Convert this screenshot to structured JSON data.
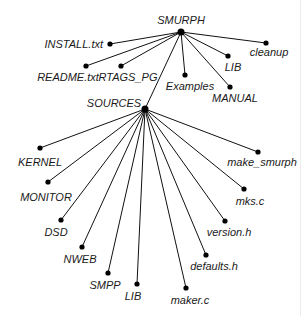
{
  "diagram": {
    "type": "tree",
    "root": "SMURPH",
    "nodes": [
      {
        "id": "smurph",
        "label": "SMURPH",
        "x": 181,
        "y": 32,
        "r": 3.5,
        "lx": 181,
        "ly": 24,
        "anchor": "middle"
      },
      {
        "id": "install",
        "label": "INSTALL.txt",
        "x": 110,
        "y": 44,
        "r": 2.6,
        "lx": 103,
        "ly": 48,
        "anchor": "end"
      },
      {
        "id": "readme",
        "label": "README.txt",
        "x": 86,
        "y": 66,
        "r": 2.6,
        "lx": 68,
        "ly": 81,
        "anchor": "middle"
      },
      {
        "id": "rtags",
        "label": "RTAGS_PG",
        "x": 121,
        "y": 66,
        "r": 2.6,
        "lx": 128,
        "ly": 81,
        "anchor": "middle"
      },
      {
        "id": "examples",
        "label": "Examples",
        "x": 185,
        "y": 75,
        "r": 2.6,
        "lx": 190,
        "ly": 90,
        "anchor": "middle"
      },
      {
        "id": "lib_top",
        "label": "LIB",
        "x": 228,
        "y": 56,
        "r": 2.6,
        "lx": 233,
        "ly": 71,
        "anchor": "middle"
      },
      {
        "id": "manual",
        "label": "MANUAL",
        "x": 230,
        "y": 87,
        "r": 2.6,
        "lx": 235,
        "ly": 102,
        "anchor": "middle"
      },
      {
        "id": "cleanup",
        "label": "cleanup",
        "x": 266,
        "y": 43,
        "r": 2.6,
        "lx": 269,
        "ly": 56,
        "anchor": "middle"
      },
      {
        "id": "sources",
        "label": "SOURCES",
        "x": 145,
        "y": 109,
        "r": 3.5,
        "lx": 114,
        "ly": 107,
        "anchor": "middle"
      },
      {
        "id": "kernel",
        "label": "KERNEL",
        "x": 40,
        "y": 148,
        "r": 2.6,
        "lx": 40,
        "ly": 166,
        "anchor": "middle"
      },
      {
        "id": "monitor",
        "label": "MONITOR",
        "x": 48,
        "y": 182,
        "r": 2.6,
        "lx": 46,
        "ly": 201,
        "anchor": "middle"
      },
      {
        "id": "dsd",
        "label": "DSD",
        "x": 61,
        "y": 220,
        "r": 2.6,
        "lx": 56,
        "ly": 236,
        "anchor": "middle"
      },
      {
        "id": "nweb",
        "label": "NWEB",
        "x": 82,
        "y": 247,
        "r": 2.6,
        "lx": 80,
        "ly": 263,
        "anchor": "middle"
      },
      {
        "id": "smpp",
        "label": "SMPP",
        "x": 108,
        "y": 273,
        "r": 2.6,
        "lx": 105,
        "ly": 289,
        "anchor": "middle"
      },
      {
        "id": "lib_src",
        "label": "LIB",
        "x": 137,
        "y": 284,
        "r": 2.6,
        "lx": 133,
        "ly": 300,
        "anchor": "middle"
      },
      {
        "id": "maker",
        "label": "maker.c",
        "x": 186,
        "y": 288,
        "r": 2.6,
        "lx": 190,
        "ly": 304,
        "anchor": "middle"
      },
      {
        "id": "defaults",
        "label": "defaults.h",
        "x": 206,
        "y": 255,
        "r": 2.6,
        "lx": 214,
        "ly": 270,
        "anchor": "middle"
      },
      {
        "id": "version",
        "label": "version.h",
        "x": 225,
        "y": 221,
        "r": 2.6,
        "lx": 229,
        "ly": 236,
        "anchor": "middle"
      },
      {
        "id": "mks",
        "label": "mks.c",
        "x": 244,
        "y": 189,
        "r": 2.6,
        "lx": 250,
        "ly": 205,
        "anchor": "middle"
      },
      {
        "id": "make_smurph",
        "label": "make_smurph",
        "x": 258,
        "y": 152,
        "r": 2.6,
        "lx": 262,
        "ly": 166,
        "anchor": "middle"
      }
    ],
    "edges": [
      [
        "smurph",
        "install"
      ],
      [
        "smurph",
        "readme"
      ],
      [
        "smurph",
        "rtags"
      ],
      [
        "smurph",
        "examples"
      ],
      [
        "smurph",
        "lib_top"
      ],
      [
        "smurph",
        "manual"
      ],
      [
        "smurph",
        "cleanup"
      ],
      [
        "smurph",
        "sources"
      ],
      [
        "sources",
        "kernel"
      ],
      [
        "sources",
        "monitor"
      ],
      [
        "sources",
        "dsd"
      ],
      [
        "sources",
        "nweb"
      ],
      [
        "sources",
        "smpp"
      ],
      [
        "sources",
        "lib_src"
      ],
      [
        "sources",
        "maker"
      ],
      [
        "sources",
        "defaults"
      ],
      [
        "sources",
        "version"
      ],
      [
        "sources",
        "mks"
      ],
      [
        "sources",
        "make_smurph"
      ]
    ]
  }
}
